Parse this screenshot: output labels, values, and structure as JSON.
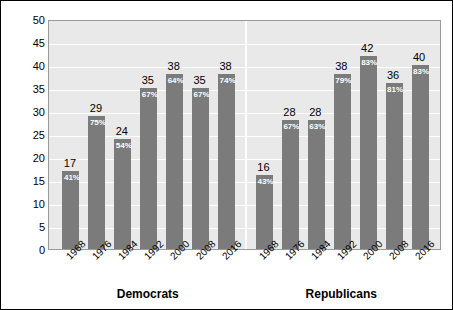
{
  "chart_data": {
    "type": "bar",
    "title": "",
    "subtitle": "",
    "xlabel": "",
    "ylabel": "Number of states",
    "ylim": [
      0,
      50
    ],
    "ytick_step": 5,
    "yticks": [
      50,
      45,
      40,
      35,
      30,
      25,
      20,
      15,
      10,
      5,
      0
    ],
    "grid": true,
    "legend": "none",
    "bar_color": "#7b7b7b",
    "plot_background": "#e9e9e9",
    "gridline_color": "#ffffff",
    "groups": [
      {
        "name": "Democrats",
        "categories": [
          "1968",
          "1976",
          "1984",
          "1992",
          "2000",
          "2008",
          "2016"
        ],
        "values": [
          17,
          29,
          24,
          35,
          38,
          35,
          38
        ],
        "percent_labels": [
          "41%",
          "75%",
          "54%",
          "67%",
          "64%",
          "67%",
          "74%"
        ]
      },
      {
        "name": "Republicans",
        "categories": [
          "1968",
          "1976",
          "1984",
          "1992",
          "2000",
          "2008",
          "2016"
        ],
        "values": [
          16,
          28,
          28,
          38,
          42,
          36,
          40
        ],
        "percent_labels": [
          "43%",
          "67%",
          "63%",
          "79%",
          "83%",
          "81%",
          "83%"
        ]
      }
    ]
  },
  "axis": {
    "y_title": "Number of states"
  },
  "group_labels": {
    "democrats": "Democrats",
    "republicans": "Republicans"
  }
}
